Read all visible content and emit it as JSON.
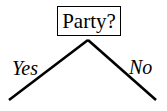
{
  "diagram": {
    "type": "decision-tree",
    "root": {
      "label": "Party?"
    },
    "branches": [
      {
        "label": "Yes",
        "direction": "left"
      },
      {
        "label": "No",
        "direction": "right"
      }
    ]
  }
}
